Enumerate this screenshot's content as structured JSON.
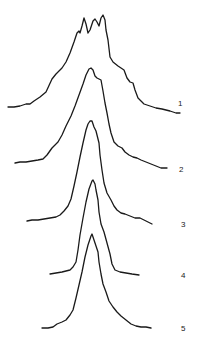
{
  "chart_data": {
    "type": "line",
    "title": "",
    "xlabel": "",
    "ylabel": "",
    "grid": false,
    "legend": "none",
    "layout": "vertically stacked offset spectra (waterfall), numbered on the right",
    "series": [
      {
        "name": "1",
        "label": "1",
        "label_pos": [
          178,
          106
        ],
        "points": [
          [
            8,
            107
          ],
          [
            14,
            107
          ],
          [
            20,
            106
          ],
          [
            26,
            104
          ],
          [
            30,
            104
          ],
          [
            34,
            101
          ],
          [
            40,
            97
          ],
          [
            46,
            92
          ],
          [
            52,
            79
          ],
          [
            56,
            74
          ],
          [
            62,
            68
          ],
          [
            66,
            62
          ],
          [
            70,
            53
          ],
          [
            74,
            42
          ],
          [
            77,
            33
          ],
          [
            79,
            31
          ],
          [
            80,
            33
          ],
          [
            82,
            26
          ],
          [
            84,
            18
          ],
          [
            86,
            24
          ],
          [
            88,
            33
          ],
          [
            90,
            30
          ],
          [
            93,
            21
          ],
          [
            95,
            19
          ],
          [
            97,
            22
          ],
          [
            99,
            26
          ],
          [
            101,
            18
          ],
          [
            103,
            15
          ],
          [
            105,
            20
          ],
          [
            106,
            30
          ],
          [
            108,
            40
          ],
          [
            110,
            57
          ],
          [
            113,
            62
          ],
          [
            118,
            66
          ],
          [
            124,
            70
          ],
          [
            127,
            78
          ],
          [
            130,
            82
          ],
          [
            133,
            83
          ],
          [
            135,
            90
          ],
          [
            138,
            98
          ],
          [
            144,
            104
          ],
          [
            150,
            106
          ],
          [
            156,
            108
          ],
          [
            162,
            109
          ],
          [
            170,
            111
          ],
          [
            176,
            113
          ],
          [
            180,
            113
          ]
        ]
      },
      {
        "name": "2",
        "label": "2",
        "label_pos": [
          179,
          172
        ],
        "points": [
          [
            15,
            163
          ],
          [
            20,
            162
          ],
          [
            26,
            162
          ],
          [
            32,
            161
          ],
          [
            38,
            160
          ],
          [
            43,
            159
          ],
          [
            47,
            155
          ],
          [
            52,
            148
          ],
          [
            58,
            142
          ],
          [
            62,
            135
          ],
          [
            66,
            126
          ],
          [
            71,
            116
          ],
          [
            75,
            106
          ],
          [
            79,
            95
          ],
          [
            83,
            84
          ],
          [
            86,
            75
          ],
          [
            89,
            69
          ],
          [
            91,
            68
          ],
          [
            93,
            70
          ],
          [
            95,
            76
          ],
          [
            97,
            78
          ],
          [
            99,
            79
          ],
          [
            101,
            80
          ],
          [
            103,
            91
          ],
          [
            105,
            103
          ],
          [
            107,
            113
          ],
          [
            109,
            124
          ],
          [
            111,
            133
          ],
          [
            114,
            142
          ],
          [
            118,
            146
          ],
          [
            122,
            148
          ],
          [
            125,
            152
          ],
          [
            129,
            155
          ],
          [
            133,
            157
          ],
          [
            137,
            158
          ],
          [
            141,
            160
          ],
          [
            146,
            162
          ],
          [
            151,
            164
          ],
          [
            156,
            166
          ],
          [
            161,
            168
          ],
          [
            167,
            168
          ]
        ]
      },
      {
        "name": "3",
        "label": "3",
        "label_pos": [
          181,
          227
        ],
        "points": [
          [
            27,
            221
          ],
          [
            32,
            220
          ],
          [
            38,
            220
          ],
          [
            44,
            219
          ],
          [
            50,
            218
          ],
          [
            56,
            217
          ],
          [
            60,
            215
          ],
          [
            64,
            211
          ],
          [
            68,
            206
          ],
          [
            71,
            199
          ],
          [
            74,
            186
          ],
          [
            77,
            172
          ],
          [
            80,
            157
          ],
          [
            83,
            143
          ],
          [
            86,
            130
          ],
          [
            88,
            124
          ],
          [
            90,
            121
          ],
          [
            92,
            121
          ],
          [
            94,
            127
          ],
          [
            96,
            131
          ],
          [
            97,
            135
          ],
          [
            99,
            143
          ],
          [
            100,
            155
          ],
          [
            102,
            170
          ],
          [
            104,
            183
          ],
          [
            107,
            193
          ],
          [
            111,
            200
          ],
          [
            114,
            206
          ],
          [
            117,
            210
          ],
          [
            121,
            213
          ],
          [
            125,
            214
          ],
          [
            130,
            216
          ],
          [
            135,
            218
          ],
          [
            140,
            218
          ],
          [
            146,
            221
          ],
          [
            152,
            224
          ]
        ]
      },
      {
        "name": "4",
        "label": "4",
        "label_pos": [
          181,
          278
        ],
        "points": [
          [
            50,
            274
          ],
          [
            56,
            273
          ],
          [
            62,
            272
          ],
          [
            66,
            271
          ],
          [
            70,
            270
          ],
          [
            73,
            267
          ],
          [
            76,
            262
          ],
          [
            78,
            250
          ],
          [
            80,
            235
          ],
          [
            83,
            218
          ],
          [
            86,
            202
          ],
          [
            89,
            189
          ],
          [
            92,
            181
          ],
          [
            93,
            180
          ],
          [
            95,
            184
          ],
          [
            96,
            190
          ],
          [
            98,
            200
          ],
          [
            99,
            212
          ],
          [
            101,
            224
          ],
          [
            104,
            232
          ],
          [
            107,
            243
          ],
          [
            110,
            254
          ],
          [
            112,
            264
          ],
          [
            115,
            270
          ],
          [
            120,
            272
          ],
          [
            126,
            273
          ],
          [
            132,
            274
          ],
          [
            139,
            275
          ]
        ]
      },
      {
        "name": "5",
        "label": "5",
        "label_pos": [
          181,
          331
        ],
        "points": [
          [
            42,
            328
          ],
          [
            48,
            328
          ],
          [
            53,
            327
          ],
          [
            57,
            324
          ],
          [
            62,
            322
          ],
          [
            66,
            320
          ],
          [
            70,
            315
          ],
          [
            73,
            310
          ],
          [
            76,
            298
          ],
          [
            79,
            285
          ],
          [
            82,
            272
          ],
          [
            85,
            257
          ],
          [
            88,
            245
          ],
          [
            91,
            236
          ],
          [
            92,
            234
          ],
          [
            94,
            240
          ],
          [
            96,
            246
          ],
          [
            98,
            252
          ],
          [
            99,
            262
          ],
          [
            101,
            274
          ],
          [
            103,
            284
          ],
          [
            106,
            292
          ],
          [
            109,
            301
          ],
          [
            113,
            307
          ],
          [
            117,
            312
          ],
          [
            121,
            316
          ],
          [
            126,
            320
          ],
          [
            131,
            324
          ],
          [
            136,
            326
          ],
          [
            141,
            327
          ],
          [
            146,
            327
          ],
          [
            151,
            328
          ]
        ]
      }
    ],
    "stroke_color": "#1a1a1a",
    "background": "#ffffff"
  }
}
